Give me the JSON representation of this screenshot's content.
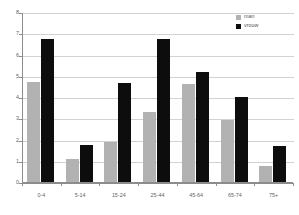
{
  "chart_data": {
    "type": "bar",
    "title": "",
    "subtitle": "",
    "xlabel": "",
    "ylabel": "",
    "ylim": [
      0,
      8
    ],
    "ytick_labels": [
      "0",
      "1",
      "2",
      "3",
      "4",
      "5",
      "6",
      "7",
      "8"
    ],
    "ytick_values": [
      0,
      1,
      2,
      3,
      4,
      5,
      6,
      7,
      8
    ],
    "grid": true,
    "legend_position": "top-right",
    "categories": [
      "0-4",
      "5-14",
      "15-24",
      "25-44",
      "45-64",
      "65-74",
      "75+"
    ],
    "series": [
      {
        "name": "man",
        "color": "#b2b2b2",
        "values": [
          4.7,
          1.1,
          1.9,
          3.3,
          4.6,
          2.9,
          0.75
        ]
      },
      {
        "name": "vrouw",
        "color": "#0d0d0d",
        "values": [
          6.75,
          1.75,
          4.65,
          6.75,
          5.2,
          4.0,
          1.7
        ]
      }
    ]
  },
  "legend": {
    "items": [
      {
        "label": "man",
        "color": "#b2b2b2"
      },
      {
        "label": "vrouw",
        "color": "#0d0d0d"
      }
    ]
  },
  "axes": {
    "y_min": 0,
    "y_max": 8,
    "axis_color": "#8c8c8c",
    "grid_color": "#d2d2d2"
  }
}
